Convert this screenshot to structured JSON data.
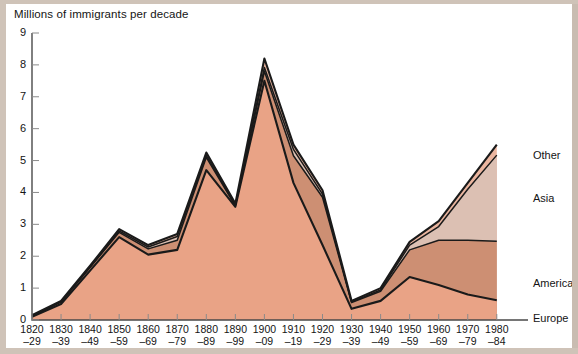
{
  "chart_data": {
    "type": "area",
    "title": "Millions of immigrants per decade",
    "subtitle": "",
    "xlabel": "",
    "ylabel": "Millions of immigrants per decade",
    "stacked": true,
    "grid": false,
    "legend_position": "right",
    "ylim": [
      0,
      9
    ],
    "yticks": [
      "0",
      "1",
      "2",
      "3",
      "4",
      "5",
      "6",
      "7",
      "8",
      "9"
    ],
    "categories": [
      "1820–29",
      "1830–39",
      "1840–49",
      "1850–59",
      "1860–69",
      "1870–79",
      "1880–89",
      "1890–99",
      "1900–09",
      "1910–19",
      "1920–29",
      "1930–39",
      "1940–49",
      "1950–59",
      "1960–69",
      "1970–79",
      "1980–84"
    ],
    "category_top": [
      "1820",
      "1830",
      "1840",
      "1850",
      "1860",
      "1870",
      "1880",
      "1890",
      "1900",
      "1910",
      "1920",
      "1930",
      "1940",
      "1950",
      "1960",
      "1970",
      "1980"
    ],
    "category_bottom": [
      "–29",
      "–39",
      "–49",
      "–59",
      "–69",
      "–79",
      "–89",
      "–99",
      "–09",
      "–19",
      "–29",
      "–39",
      "–49",
      "–59",
      "–69",
      "–79",
      "–84"
    ],
    "series": [
      {
        "name": "Europe",
        "color": "#e9a386",
        "values": [
          0.1,
          0.5,
          1.55,
          2.6,
          2.05,
          2.2,
          4.7,
          3.55,
          7.5,
          4.3,
          2.35,
          0.35,
          0.6,
          1.35,
          1.1,
          0.8,
          0.62
        ]
      },
      {
        "name": "America",
        "color": "#cd8f73",
        "values": [
          0.03,
          0.07,
          0.1,
          0.15,
          0.18,
          0.3,
          0.4,
          0.03,
          0.3,
          0.85,
          1.5,
          0.2,
          0.3,
          0.85,
          1.4,
          1.7,
          1.85
        ]
      },
      {
        "name": "Asia",
        "color": "#dcc0b3",
        "values": [
          0.0,
          0.0,
          0.0,
          0.04,
          0.06,
          0.12,
          0.06,
          0.02,
          0.12,
          0.2,
          0.1,
          0.02,
          0.04,
          0.15,
          0.43,
          1.6,
          2.7
        ]
      },
      {
        "name": "Other",
        "color": "#eab59f",
        "values": [
          0.02,
          0.03,
          0.05,
          0.06,
          0.06,
          0.08,
          0.09,
          0.05,
          0.28,
          0.15,
          0.12,
          0.03,
          0.06,
          0.1,
          0.17,
          0.2,
          0.33
        ]
      }
    ],
    "totals": [
      0.15,
      0.6,
      1.7,
      2.85,
      2.35,
      2.7,
      5.25,
      3.65,
      8.2,
      5.5,
      4.07,
      0.6,
      1.0,
      2.45,
      3.1,
      4.3,
      5.5
    ],
    "legend_entries": [
      "Other",
      "Asia",
      "America",
      "Europe"
    ]
  },
  "axes": {
    "y_axis_name": "y-axis",
    "x_axis_name": "x-axis"
  },
  "colors": {
    "europe": "#e9a386",
    "america": "#cd8f73",
    "asia": "#dcc0b3",
    "other": "#eab59f",
    "outline": "#1a1a1a",
    "background": "#ffffff",
    "frame": "#cfc3b8"
  }
}
